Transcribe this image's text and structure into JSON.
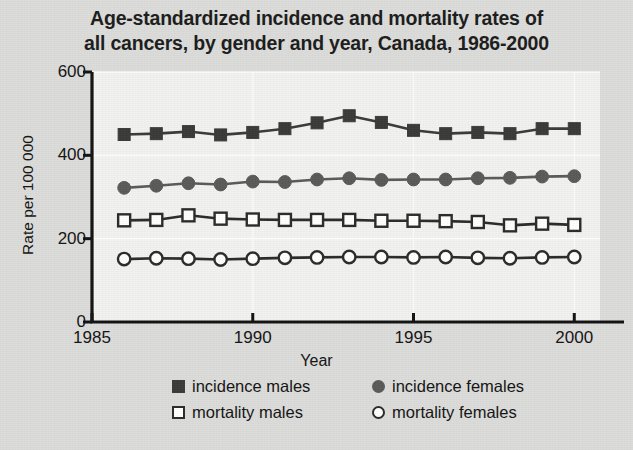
{
  "chart_data": {
    "type": "line",
    "title": "Age-standardized incidence and mortality rates of all cancers, by gender and year, Canada, 1986-2000",
    "title_lines": [
      "Age-standardized incidence and mortality rates of",
      "all cancers, by gender and year, Canada, 1986-2000"
    ],
    "xlabel": "Year",
    "ylabel": "Rate per 100 000",
    "x": [
      1986,
      1987,
      1988,
      1989,
      1990,
      1991,
      1992,
      1993,
      1994,
      1995,
      1996,
      1997,
      1998,
      1999,
      2000
    ],
    "xlim": [
      1985,
      2000.8
    ],
    "ylim": [
      0,
      600
    ],
    "xticks": [
      1985,
      1990,
      1995,
      2000
    ],
    "xtick_labels": [
      "1985",
      "1990",
      "1995",
      "2000"
    ],
    "yticks": [
      0,
      200,
      400,
      600
    ],
    "ytick_labels": [
      "0",
      "200",
      "400",
      "600"
    ],
    "grid": "faint-horizontal",
    "legend_position": "bottom",
    "series": [
      {
        "name": "incidence males",
        "marker": "filled-square",
        "color": "#3a3a3a",
        "values": [
          450,
          452,
          457,
          449,
          455,
          464,
          478,
          495,
          479,
          460,
          452,
          455,
          452,
          464,
          464
        ]
      },
      {
        "name": "incidence females",
        "marker": "filled-circle",
        "color": "#5a5a5a",
        "values": [
          322,
          327,
          333,
          330,
          337,
          336,
          342,
          345,
          341,
          342,
          342,
          345,
          346,
          349,
          350
        ]
      },
      {
        "name": "mortality males",
        "marker": "open-square",
        "color": "#2b2b2b",
        "values": [
          244,
          245,
          256,
          248,
          246,
          245,
          245,
          245,
          243,
          243,
          242,
          240,
          232,
          236,
          233
        ]
      },
      {
        "name": "mortality females",
        "marker": "open-circle",
        "color": "#2b2b2b",
        "values": [
          151,
          153,
          152,
          150,
          152,
          154,
          155,
          156,
          156,
          155,
          156,
          154,
          153,
          155,
          156
        ]
      }
    ]
  },
  "legend": {
    "rows": [
      [
        {
          "label": "incidence males",
          "marker": "filled-square"
        },
        {
          "label": "incidence females",
          "marker": "filled-circle"
        }
      ],
      [
        {
          "label": "mortality males",
          "marker": "open-square"
        },
        {
          "label": "mortality females",
          "marker": "open-circle"
        }
      ]
    ]
  },
  "colors": {
    "page_background": "#dcdcda",
    "plot_background": "#f2f2f0",
    "axis": "#121212",
    "text": "#141414",
    "incidence_males": "#3a3a3a",
    "incidence_females": "#5a5a5a",
    "mortality_males": "#2b2b2b",
    "mortality_females": "#2b2b2b"
  }
}
